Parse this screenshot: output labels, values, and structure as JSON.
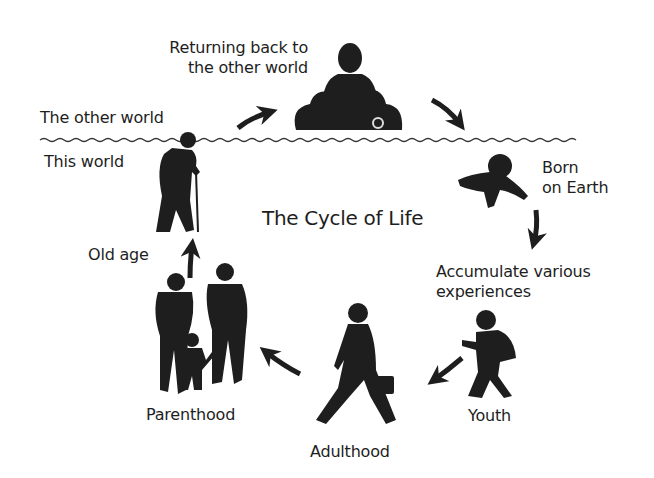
{
  "diagram": {
    "title": "The Cycle of Life",
    "realms": {
      "upper": "The other world",
      "lower": "This world"
    },
    "stages": [
      {
        "id": "return",
        "label_lines": [
          "Returning back to",
          "the other world"
        ],
        "icon": "meditating-figure-on-cloud-icon"
      },
      {
        "id": "born",
        "label_lines": [
          "Born",
          "on Earth"
        ],
        "icon": "crawling-baby-icon"
      },
      {
        "id": "experiences",
        "label_lines": [
          "Accumulate various",
          "experiences"
        ],
        "icon": null
      },
      {
        "id": "youth",
        "label_lines": [
          "Youth"
        ],
        "icon": "walking-child-with-backpack-icon"
      },
      {
        "id": "adulthood",
        "label_lines": [
          "Adulthood"
        ],
        "icon": "businessman-with-briefcase-icon"
      },
      {
        "id": "parenthood",
        "label_lines": [
          "Parenthood"
        ],
        "icon": "family-parents-and-child-icon"
      },
      {
        "id": "old_age",
        "label_lines": [
          "Old age"
        ],
        "icon": "elderly-man-with-cane-icon"
      }
    ],
    "flow_order": [
      "born",
      "experiences",
      "youth",
      "adulthood",
      "parenthood",
      "old_age",
      "return",
      "born"
    ],
    "colors": {
      "ink": "#1e1e1e",
      "background": "#ffffff",
      "divider": "#333333"
    }
  }
}
